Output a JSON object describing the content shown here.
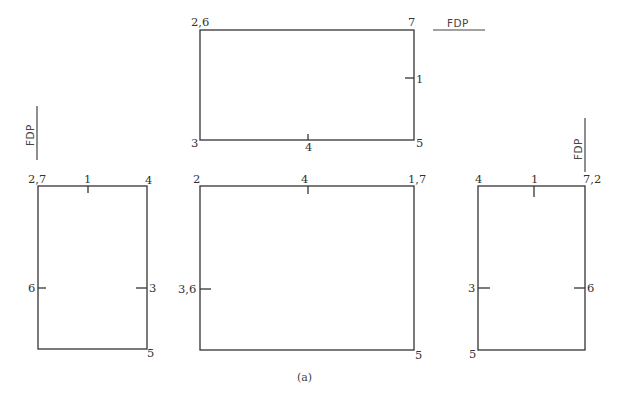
{
  "figure": {
    "caption": "(a)",
    "fdp_label": "FDP",
    "top_view": {
      "corners": {
        "top_left": "2,6",
        "top_right": "7",
        "bottom_left": "3",
        "bottom_right": "5"
      },
      "marks": {
        "right_mid": "1",
        "bottom_mid": "4"
      }
    },
    "left_view": {
      "corners": {
        "top_left": "2,7",
        "top_right": "4",
        "bottom_right": "5"
      },
      "marks": {
        "top_mid": "1",
        "left_mid": "6",
        "right_mid": "3"
      }
    },
    "front_view": {
      "corners": {
        "top_left": "2",
        "top_right": "1,7",
        "bottom_right": "5"
      },
      "marks": {
        "top_mid": "4",
        "left_mid": "3,6"
      }
    },
    "right_view": {
      "corners": {
        "top_left": "4",
        "top_right": "7,2",
        "bottom_left": "5"
      },
      "marks": {
        "top_mid": "1",
        "left_mid": "3",
        "right_mid": "6"
      }
    }
  }
}
